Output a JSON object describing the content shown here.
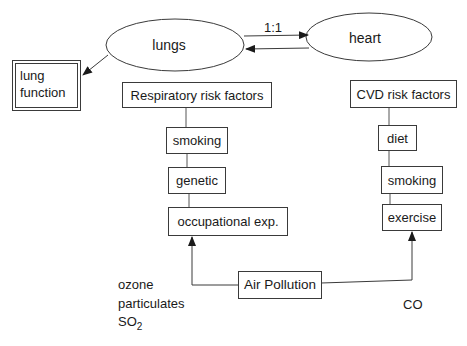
{
  "diagram": {
    "nodes": {
      "lungs": "lungs",
      "heart": "heart",
      "lung_function": "lung function",
      "respiratory_risk_factors": "Respiratory risk factors",
      "resp_smoking": "smoking",
      "resp_genetic": "genetic",
      "resp_occupational": "occupational exp.",
      "cvd_risk_factors": "CVD risk factors",
      "cvd_diet": "diet",
      "cvd_smoking": "smoking",
      "cvd_exercise": "exercise",
      "air_pollution": "Air Pollution"
    },
    "edge_labels": {
      "lungs_heart_ratio": "1:1"
    },
    "pollutants_left": {
      "line1": "ozone",
      "line2": "particulates",
      "so2_base": "SO",
      "so2_sub": "2"
    },
    "pollutants_right": "CO",
    "colors": {
      "line": "#3a3a3a",
      "background": "#ffffff"
    }
  }
}
